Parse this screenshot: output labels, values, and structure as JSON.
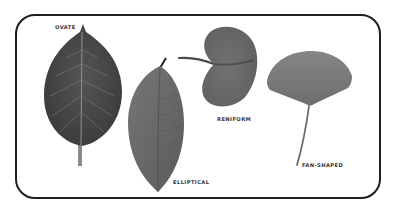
{
  "figure": {
    "frame_color": "#1e1e1e",
    "leaves": [
      {
        "name": "ovate",
        "label": "OVATE",
        "color": "#4a4a4a"
      },
      {
        "name": "elliptical",
        "label": "ELLIPTICAL",
        "color": "#686868"
      },
      {
        "name": "reniform",
        "label": "RENIFORM",
        "color": "#6a6a6a"
      },
      {
        "name": "fan-shaped",
        "label": "FAN-SHAPED",
        "color": "#7a7a7a"
      }
    ]
  }
}
